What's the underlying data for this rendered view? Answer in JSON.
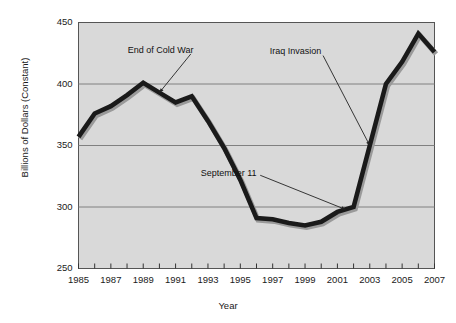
{
  "chart_data": {
    "type": "line",
    "title": "",
    "xlabel": "Year",
    "ylabel": "Billions of Dollars (Constant)",
    "xlim": [
      1985,
      2007
    ],
    "ylim": [
      250,
      450
    ],
    "ytick_labels": [
      "450",
      "400",
      "350",
      "300",
      "250"
    ],
    "ytick_values": [
      450,
      400,
      350,
      300,
      250
    ],
    "xtick_labels": [
      "1985",
      "1987",
      "1989",
      "1991",
      "1993",
      "1995",
      "1997",
      "1999",
      "2001",
      "2003",
      "2005",
      "2007"
    ],
    "xtick_values": [
      1985,
      1987,
      1989,
      1991,
      1993,
      1995,
      1997,
      1999,
      2001,
      2003,
      2005,
      2007
    ],
    "minor_xticks": [
      1986,
      1988,
      1990,
      1992,
      1994,
      1996,
      1998,
      2000,
      2002,
      2004,
      2006
    ],
    "grid": "horizontal",
    "legend": "none",
    "x": [
      1985,
      1986,
      1987,
      1988,
      1989,
      1990,
      1991,
      1992,
      1993,
      1994,
      1995,
      1996,
      1997,
      1998,
      1999,
      2000,
      2001,
      2002,
      2003,
      2004,
      2005,
      2006,
      2007
    ],
    "values": [
      357,
      376,
      382,
      391,
      401,
      393,
      385,
      390,
      370,
      348,
      322,
      291,
      290,
      287,
      285,
      288,
      296,
      300,
      350,
      400,
      418,
      441,
      426
    ],
    "series": [
      {
        "name": "Defense Spending",
        "color": "#1a1a1a",
        "values": [
          357,
          376,
          382,
          391,
          401,
          393,
          385,
          390,
          370,
          348,
          322,
          291,
          290,
          287,
          285,
          288,
          296,
          300,
          350,
          400,
          418,
          441,
          426
        ]
      }
    ],
    "annotations": [
      {
        "label": "End of Cold War",
        "x": 1990,
        "y": 393,
        "text_x": 1992.1,
        "text_y": 427
      },
      {
        "label": "Iraq Invasion",
        "x": 2003,
        "y": 350,
        "text_x": 2000.0,
        "text_y": 426
      },
      {
        "label": "September 11",
        "x": 2001.5,
        "y": 298,
        "text_x": 1996.0,
        "text_y": 327
      }
    ],
    "plot_background": "#d9d9d9",
    "grid_color": "#808080",
    "axis_color": "#555555",
    "line_color": "#1a1a1a",
    "shadow_color": "#9a9a9a"
  }
}
